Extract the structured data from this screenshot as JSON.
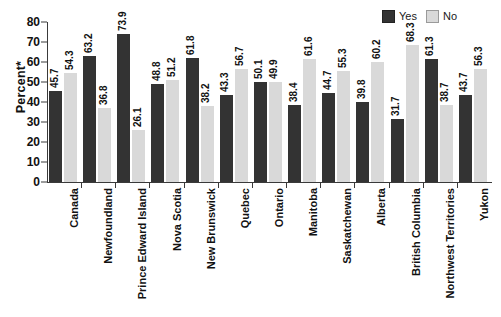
{
  "chart_data": {
    "type": "bar",
    "title": "",
    "xlabel": "",
    "ylabel": "Percent*",
    "ylim": [
      0,
      80
    ],
    "yticks": [
      0,
      10,
      20,
      30,
      40,
      50,
      60,
      70,
      80
    ],
    "grid": false,
    "legend_position": "top-right",
    "categories": [
      "Canada",
      "Newfoundland",
      "Prince Edward Island",
      "Nova Scotia",
      "New Brunswick",
      "Quebec",
      "Ontario",
      "Manitoba",
      "Saskatchewan",
      "Alberta",
      "British Columbia",
      "Northwest Territories",
      "Yukon"
    ],
    "series": [
      {
        "name": "Yes",
        "color": "#333333",
        "values": [
          45.7,
          63.2,
          73.9,
          48.8,
          61.8,
          43.3,
          50.1,
          38.4,
          44.7,
          39.8,
          31.7,
          61.3,
          43.7
        ]
      },
      {
        "name": "No",
        "color": "#d9d9d9",
        "values": [
          54.3,
          36.8,
          26.1,
          51.2,
          38.2,
          56.7,
          49.9,
          61.6,
          55.3,
          60.2,
          68.3,
          38.7,
          56.3
        ]
      }
    ]
  },
  "legend": {
    "entries": [
      {
        "label": "Yes",
        "swatch": "dark-swatch-icon"
      },
      {
        "label": "No",
        "swatch": "light-swatch-icon"
      }
    ]
  },
  "footnote": {
    "text": ""
  }
}
